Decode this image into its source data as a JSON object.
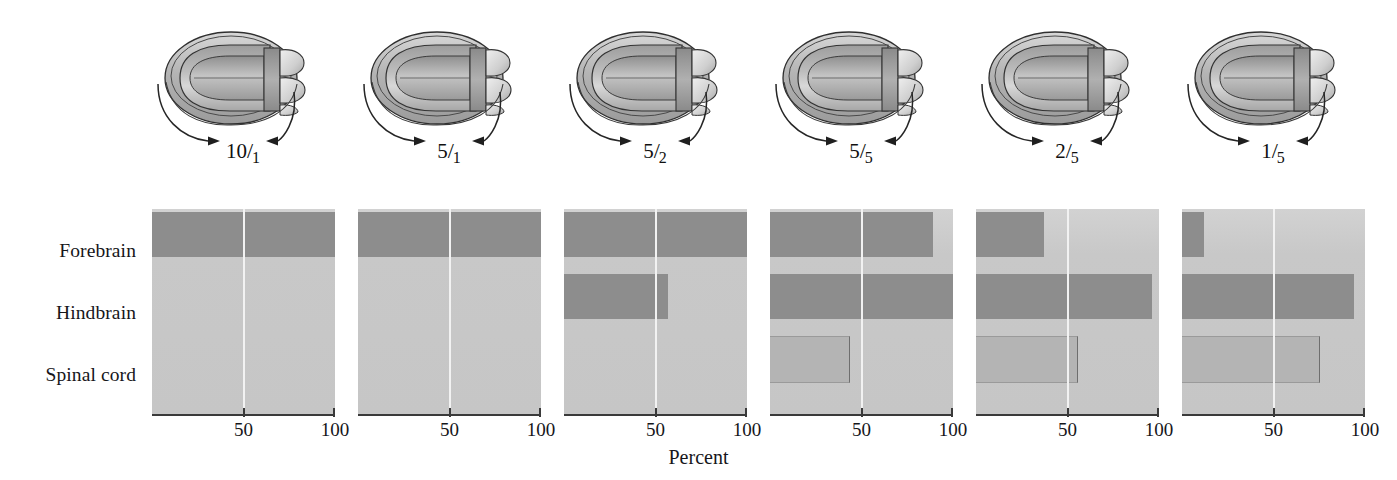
{
  "figure": {
    "row_labels": [
      "Forebrain",
      "Hindbrain",
      "Spinal cord"
    ],
    "axis_title": "Percent",
    "tick_labels": [
      "50",
      "100"
    ],
    "tick_values": [
      50,
      100
    ]
  },
  "panels": [
    {
      "ratio_numerator": "10",
      "ratio_slash": "/",
      "ratio_denominator": "1"
    },
    {
      "ratio_numerator": "5",
      "ratio_slash": "/",
      "ratio_denominator": "1"
    },
    {
      "ratio_numerator": "5",
      "ratio_slash": "/",
      "ratio_denominator": "2"
    },
    {
      "ratio_numerator": "5",
      "ratio_slash": "/",
      "ratio_denominator": "5"
    },
    {
      "ratio_numerator": "2",
      "ratio_slash": "/",
      "ratio_denominator": "5"
    },
    {
      "ratio_numerator": "1",
      "ratio_slash": "/",
      "ratio_denominator": "5"
    }
  ],
  "colors": {
    "bar_dark": "#8d8d8d",
    "bar_mid": "#b4b4b4",
    "plot_background": "#c9c9c9",
    "axis": "#3a3a3a",
    "text": "#16161a",
    "embryo_fill": "#b9b9b9",
    "embryo_outline": "#2c2c2c"
  },
  "chart_data": {
    "type": "bar",
    "title": "",
    "xlabel": "Percent",
    "ylabel": "",
    "xlim": [
      0,
      100
    ],
    "grid": false,
    "legend": "none",
    "orientation": "horizontal",
    "panel_label_meaning": "ratio label beneath each embryo diagram",
    "categories": [
      "Forebrain",
      "Hindbrain",
      "Spinal cord"
    ],
    "panels": [
      {
        "label": "10/1",
        "values": [
          100,
          0,
          0
        ],
        "shades": [
          "dark",
          "none",
          "none"
        ]
      },
      {
        "label": "5/1",
        "values": [
          100,
          0,
          0
        ],
        "shades": [
          "dark",
          "none",
          "none"
        ]
      },
      {
        "label": "5/2",
        "values": [
          100,
          57,
          0
        ],
        "shades": [
          "dark",
          "dark",
          "none"
        ]
      },
      {
        "label": "5/5",
        "values": [
          89,
          100,
          43
        ],
        "shades": [
          "dark",
          "dark",
          "mid"
        ]
      },
      {
        "label": "2/5",
        "values": [
          37,
          96,
          55
        ],
        "shades": [
          "dark",
          "dark",
          "mid"
        ]
      },
      {
        "label": "1/5",
        "values": [
          12,
          94,
          75
        ],
        "shades": [
          "dark",
          "dark",
          "mid"
        ]
      }
    ]
  }
}
